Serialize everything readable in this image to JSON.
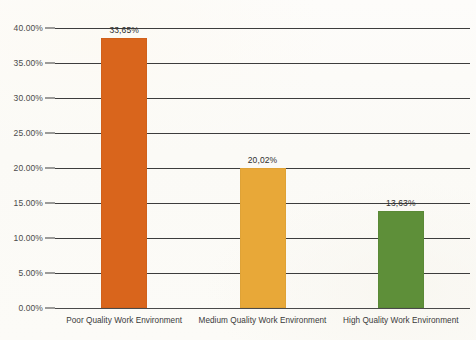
{
  "chart_data": {
    "type": "bar",
    "title": "",
    "subtitle": "",
    "xlabel": "",
    "ylabel": "",
    "categories": [
      "Poor Quality Work Environment",
      "Medium Quality Work Environment",
      "High Quality Work Environment"
    ],
    "values": [
      33.65,
      20.02,
      13.63
    ],
    "data_labels": [
      "33,65%",
      "20,02%",
      "13,63%"
    ],
    "plotted_values": [
      38.6,
      20.0,
      13.9
    ],
    "colors": [
      "#d9651c",
      "#e8a838",
      "#5e8f39"
    ],
    "ylim": [
      0,
      40
    ],
    "ytick_values": [
      40,
      35,
      30,
      25,
      20,
      15,
      10,
      5,
      0
    ],
    "ytick_labels": [
      "40.00%",
      "35.00%",
      "30.00%",
      "25.00%",
      "20.00%",
      "15.00%",
      "10.00%",
      "5.00%",
      "0.00%"
    ],
    "grid": true,
    "legend": false,
    "legend_position": "none",
    "series": [
      {
        "name": "",
        "values": [
          33.65,
          20.02,
          13.63
        ]
      }
    ]
  },
  "style": {
    "background": "#fdfcf9",
    "axis_color": "#3d3d3d",
    "label_color": "#3a3a3a",
    "value_label_color": "#2e2e2e"
  }
}
